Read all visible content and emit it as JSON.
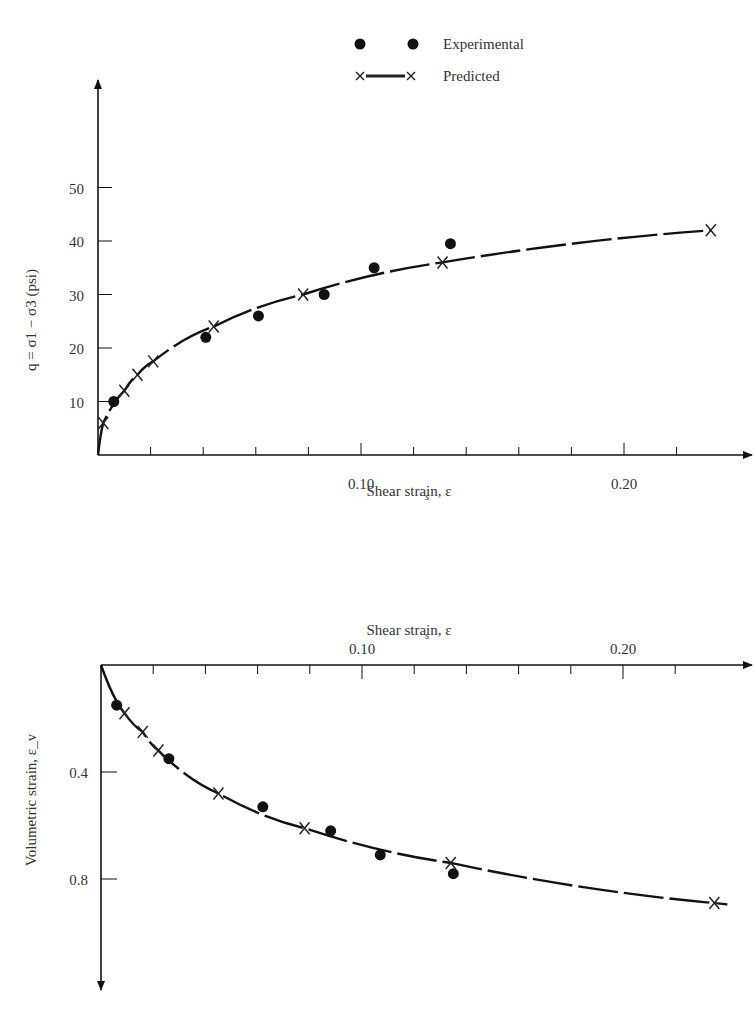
{
  "legend": {
    "experimental_label": "Experimental",
    "predicted_label": "Predicted"
  },
  "chart_data": [
    {
      "type": "scatter",
      "title": "",
      "xlabel": "Shear strain, ε_s",
      "ylabel": "q = σ1 − σ3 (psi)",
      "xlim": [
        0,
        0.24
      ],
      "ylim": [
        0,
        58
      ],
      "x_ticks": [
        {
          "value": 0.1,
          "label": "0.10"
        },
        {
          "value": 0.2,
          "label": "0.20"
        }
      ],
      "x_minor_tick_step": 0.02,
      "y_ticks": [
        {
          "value": 10,
          "label": "10"
        },
        {
          "value": 20,
          "label": "20"
        },
        {
          "value": 30,
          "label": "30"
        },
        {
          "value": 40,
          "label": "40"
        },
        {
          "value": 50,
          "label": "50"
        }
      ],
      "grid": false,
      "legend_position": "top",
      "series": [
        {
          "name": "Experimental",
          "marker": "dot",
          "x": [
            0.006,
            0.041,
            0.061,
            0.086,
            0.105,
            0.134
          ],
          "y": [
            10,
            22,
            26,
            30,
            35,
            39.5
          ]
        },
        {
          "name": "Predicted",
          "marker": "x",
          "line": true,
          "x": [
            0.002,
            0.01,
            0.015,
            0.021,
            0.044,
            0.078,
            0.131,
            0.233
          ],
          "y": [
            6,
            12,
            15,
            17.5,
            24,
            30,
            36,
            42
          ]
        }
      ]
    },
    {
      "type": "scatter",
      "title": "",
      "xlabel": "Shear strain, ε_s",
      "ylabel": "Volumetric strain, ε_v",
      "xlim": [
        0,
        0.24
      ],
      "ylim": [
        0,
        1.2
      ],
      "y_inverted": true,
      "x_ticks": [
        {
          "value": 0.1,
          "label": "0.10"
        },
        {
          "value": 0.2,
          "label": "0.20"
        }
      ],
      "x_minor_tick_step": 0.02,
      "y_ticks": [
        {
          "value": 0.4,
          "label": "0.4"
        },
        {
          "value": 0.8,
          "label": "0.8"
        }
      ],
      "grid": false,
      "series": [
        {
          "name": "Experimental",
          "marker": "dot",
          "x": [
            0.006,
            0.026,
            0.062,
            0.088,
            0.107,
            0.135
          ],
          "y": [
            0.15,
            0.35,
            0.53,
            0.62,
            0.71,
            0.78
          ]
        },
        {
          "name": "Predicted",
          "marker": "x",
          "line": true,
          "x": [
            0.009,
            0.016,
            0.022,
            0.045,
            0.078,
            0.134,
            0.235
          ],
          "y": [
            0.18,
            0.25,
            0.32,
            0.48,
            0.61,
            0.74,
            0.89
          ]
        }
      ]
    }
  ]
}
